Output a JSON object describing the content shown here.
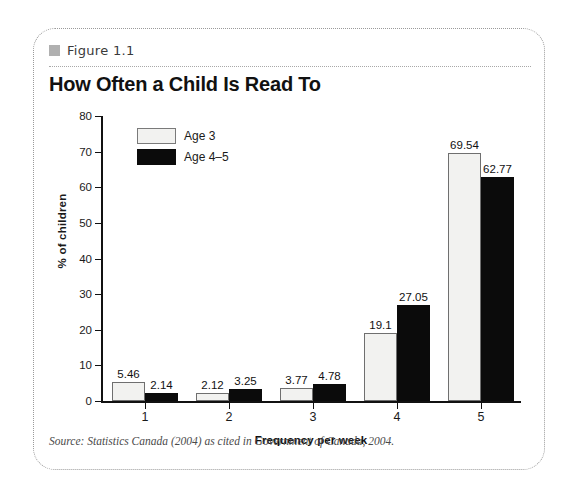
{
  "figure": {
    "label": "Figure 1.1",
    "title": "How Often a Child Is Read To",
    "source": "Source: Statistics Canada (2004) as cited in Government of Canada, 2004.",
    "bullet_color": "#b0b0b0",
    "frame_border_color": "#9a9a9a"
  },
  "legend": {
    "position": "inside-upper-left",
    "entries": [
      {
        "label": "Age 3",
        "swatch": "light",
        "color": "#f2f2f0"
      },
      {
        "label": "Age 4–5",
        "swatch": "dark",
        "color": "#0b0b0b"
      }
    ]
  },
  "axes": {
    "y_title": "% of children",
    "x_title": "Frequency per week",
    "y_ticks": [
      "0",
      "10",
      "20",
      "30",
      "40",
      "50",
      "60",
      "70",
      "80"
    ],
    "x_ticks": [
      "1",
      "2",
      "3",
      "4",
      "5"
    ]
  },
  "chart_data": {
    "type": "bar",
    "title": "How Often a Child Is Read To",
    "subtitle": "Figure 1.1",
    "xlabel": "Frequency per week",
    "ylabel": "% of children",
    "ylim": [
      0,
      80
    ],
    "ytick_step": 10,
    "grid": false,
    "legend_position": "upper left (inside plot)",
    "categories": [
      "1",
      "2",
      "3",
      "4",
      "5"
    ],
    "series": [
      {
        "name": "Age 3",
        "color": "#f2f2f0",
        "values": [
          5.46,
          2.12,
          3.77,
          19.1,
          69.54
        ],
        "labels": [
          "5.46",
          "2.12",
          "3.77",
          "19.1",
          "69.54"
        ]
      },
      {
        "name": "Age 4–5",
        "color": "#0b0b0b",
        "values": [
          2.14,
          3.25,
          4.78,
          27.05,
          62.77
        ],
        "labels": [
          "2.14",
          "3.25",
          "4.78",
          "27.05",
          "62.77"
        ]
      }
    ],
    "source": "Source: Statistics Canada (2004) as cited in Government of Canada, 2004."
  }
}
